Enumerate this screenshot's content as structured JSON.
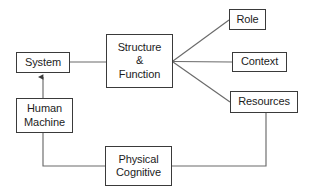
{
  "diagram": {
    "type": "block-flow-diagram",
    "background_color": "#ffffff",
    "border_color": "#3a3a3a",
    "text_color": "#1c1c1c",
    "connector_color": "#555555",
    "nodes": {
      "system": {
        "label": "System"
      },
      "human_machine": {
        "line1": "Human",
        "line2": "Machine"
      },
      "structure_function": {
        "line1": "Structure",
        "line2": "&",
        "line3": "Function"
      },
      "role": {
        "label": "Role"
      },
      "context": {
        "label": "Context"
      },
      "resources": {
        "label": "Resources"
      },
      "physical_cognitive": {
        "line1": "Physical",
        "line2": "Cognitive"
      }
    },
    "connectors": [
      {
        "name": "system-to-structure",
        "from": "system",
        "to": "structure_function",
        "arrow": false
      },
      {
        "name": "human-machine-to-system",
        "from": "human_machine",
        "to": "system",
        "arrow": true
      },
      {
        "name": "structure-to-role",
        "from": "structure_function",
        "to": "role",
        "arrow": false
      },
      {
        "name": "structure-to-context",
        "from": "structure_function",
        "to": "context",
        "arrow": false
      },
      {
        "name": "structure-to-resources",
        "from": "structure_function",
        "to": "resources",
        "arrow": false
      },
      {
        "name": "human-machine-to-physical-cognitive",
        "from": "human_machine",
        "to": "physical_cognitive",
        "arrow": false
      },
      {
        "name": "resources-to-physical-cognitive",
        "from": "resources",
        "to": "physical_cognitive",
        "arrow": false
      }
    ]
  }
}
